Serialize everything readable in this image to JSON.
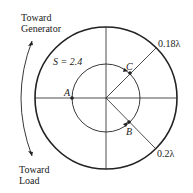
{
  "diagram": {
    "labels": {
      "toward_generator_line1": "Toward",
      "toward_generator_line2": "Generator",
      "toward_load_line1": "Toward",
      "toward_load_line2": "Load",
      "swr": "S = 2.4",
      "point_a": "A",
      "point_b": "B",
      "point_c": "C",
      "wavelength_c": "0.18λ",
      "wavelength_b": "0.2λ"
    },
    "colors": {
      "stroke": "#222222",
      "background": "#ffffff"
    }
  }
}
